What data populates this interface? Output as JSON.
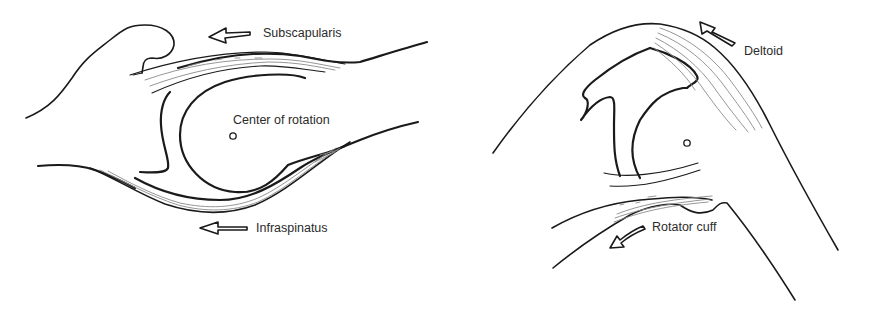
{
  "diagram": {
    "panels": [
      {
        "id": "left",
        "labels": {
          "top": "Subscapularis",
          "center": "Center of rotation",
          "bottom": "Infraspinatus"
        }
      },
      {
        "id": "right",
        "labels": {
          "top": "Deltoid",
          "bottom": "Rotator cuff"
        }
      }
    ],
    "colors": {
      "line": "#1a1a1a",
      "fiber": "#8a8a8a",
      "background": "#ffffff",
      "text": "#2b2b2b"
    }
  }
}
